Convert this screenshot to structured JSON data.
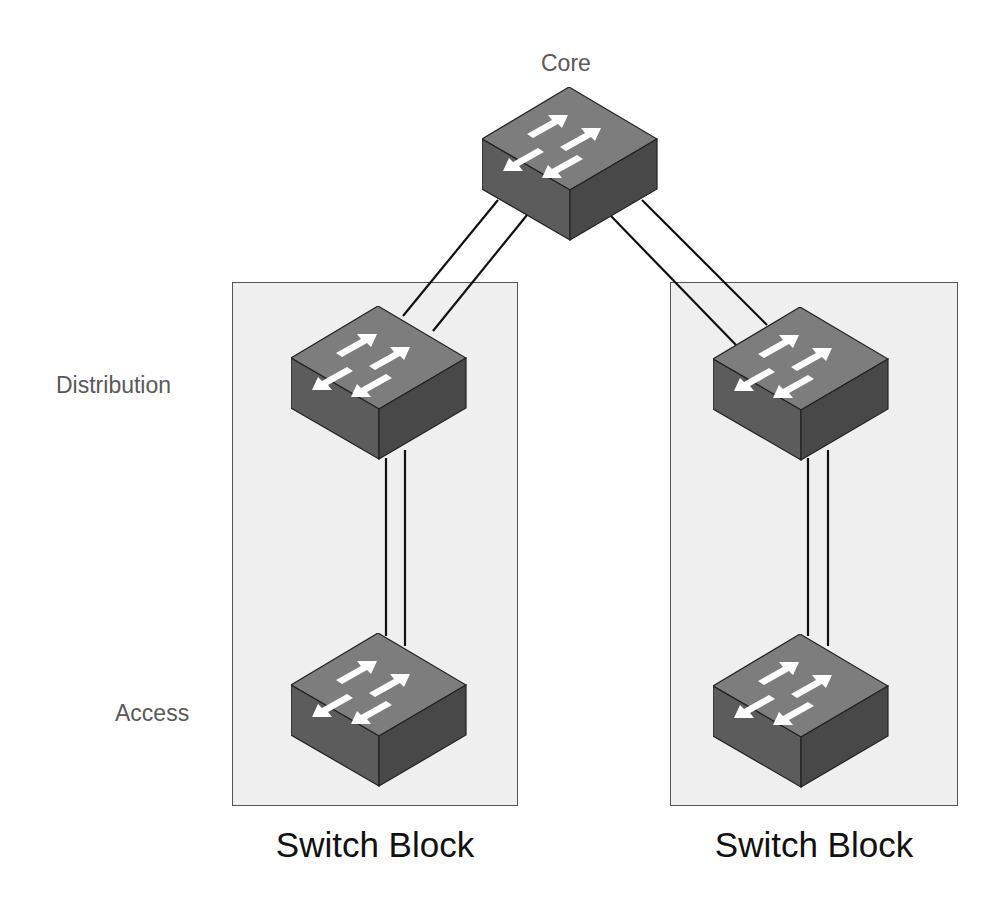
{
  "diagram": {
    "tier_labels": {
      "core": "Core",
      "distribution": "Distribution",
      "access": "Access"
    },
    "blocks": [
      {
        "id": "left",
        "label": "Switch Block"
      },
      {
        "id": "right",
        "label": "Switch Block"
      }
    ],
    "nodes": [
      {
        "id": "core",
        "tier": "Core",
        "icon": "switch-icon"
      },
      {
        "id": "dist-left",
        "tier": "Distribution",
        "icon": "switch-icon",
        "block": "left"
      },
      {
        "id": "access-left",
        "tier": "Access",
        "icon": "switch-icon",
        "block": "left"
      },
      {
        "id": "dist-right",
        "tier": "Distribution",
        "icon": "switch-icon",
        "block": "right"
      },
      {
        "id": "access-right",
        "tier": "Access",
        "icon": "switch-icon",
        "block": "right"
      }
    ],
    "links": [
      {
        "from": "core",
        "to": "dist-left",
        "count": 2
      },
      {
        "from": "core",
        "to": "dist-right",
        "count": 2
      },
      {
        "from": "dist-left",
        "to": "access-left",
        "count": 2
      },
      {
        "from": "dist-right",
        "to": "access-right",
        "count": 2
      }
    ],
    "colors": {
      "block_fill": "#efefef",
      "block_border": "#555555",
      "switch_top": "#7a7a7a",
      "switch_left": "#5a5a5a",
      "switch_right": "#474747",
      "arrow": "#ffffff",
      "link": "#111111"
    }
  }
}
